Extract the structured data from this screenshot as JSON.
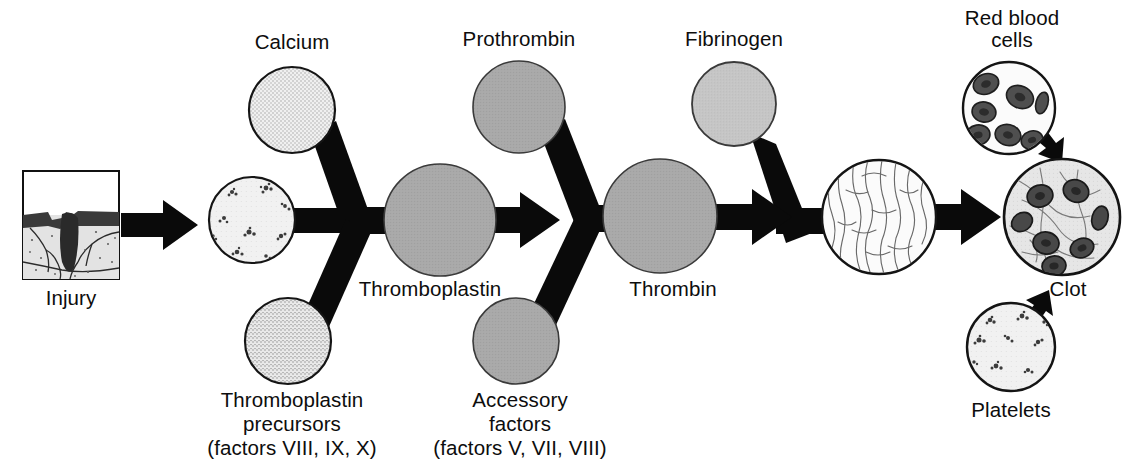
{
  "diagram": {
    "colors": {
      "ink": "#0d0d0d",
      "connector": "#0a0a0a",
      "circle_outline": "#111111",
      "pale_stipple_fill": "#efefef",
      "light_gray_fill": "#d6d6d6",
      "medium_gray_fill": "#a8a8a8",
      "dark_gray_fill": "#9a9a9a",
      "white_fill": "#fbfbfb",
      "clot_fill": "#e4e4e4",
      "cell_fill": "#4a4a4a",
      "background": "#ffffff"
    },
    "nodes": [
      {
        "id": "injury",
        "label": "Injury",
        "kind": "image-box",
        "label_position": "below",
        "cx": 71,
        "cy": 225,
        "box": {
          "x": 22,
          "y": 170,
          "w": 98,
          "h": 110
        }
      },
      {
        "id": "calcium",
        "label": "Calcium",
        "kind": "circle",
        "texture": "stipple-fine",
        "label_position": "above",
        "cx": 292,
        "cy": 110,
        "r": 43,
        "fill": "#efefef"
      },
      {
        "id": "platelets-main",
        "label": "",
        "kind": "circle",
        "texture": "platelet-clusters",
        "label_position": "none",
        "cx": 252,
        "cy": 220,
        "r": 43,
        "fill": "#f2f2f2"
      },
      {
        "id": "thromboplastin-precursors",
        "label": "Thromboplastin\nprecursors\n(factors VIII, IX, X)",
        "kind": "circle",
        "texture": "stipple-fine",
        "label_position": "below",
        "cx": 288,
        "cy": 341,
        "r": 43,
        "fill": "#e8e8e8"
      },
      {
        "id": "thromboplastin",
        "label": "Thromboplastin",
        "kind": "circle",
        "texture": "flat",
        "label_position": "below",
        "cx": 440,
        "cy": 220,
        "r": 56,
        "fill": "#adadad"
      },
      {
        "id": "prothrombin",
        "label": "Prothrombin",
        "kind": "circle",
        "texture": "flat",
        "label_position": "above",
        "cx": 519,
        "cy": 107,
        "r": 46,
        "fill": "#a6a6a6"
      },
      {
        "id": "accessory-factors",
        "label": "Accessory\nfactors\n(factors V, VII, VIII)",
        "kind": "circle",
        "texture": "flat",
        "label_position": "below",
        "cx": 516,
        "cy": 341,
        "r": 43,
        "fill": "#a3a3a3"
      },
      {
        "id": "thrombin",
        "label": "Thrombin",
        "kind": "circle",
        "texture": "flat",
        "label_position": "below",
        "cx": 660,
        "cy": 216,
        "r": 57,
        "fill": "#a8a8a8"
      },
      {
        "id": "fibrinogen",
        "label": "Fibrinogen",
        "kind": "circle",
        "texture": "flat",
        "label_position": "above",
        "cx": 734,
        "cy": 104,
        "r": 42,
        "fill": "#c4c4c4"
      },
      {
        "id": "fibrin",
        "label": "",
        "kind": "circle",
        "texture": "fibrin-strands",
        "label_position": "none",
        "cx": 879,
        "cy": 217,
        "r": 57,
        "fill": "#fbfbfb"
      },
      {
        "id": "red-blood-cells",
        "label": "Red blood\ncells",
        "kind": "circle",
        "texture": "red-blood-cells",
        "label_position": "above",
        "cx": 1009,
        "cy": 108,
        "r": 46,
        "fill": "#fbfbfb"
      },
      {
        "id": "platelets",
        "label": "Platelets",
        "kind": "circle",
        "texture": "platelet-clusters",
        "label_position": "below",
        "cx": 1011,
        "cy": 347,
        "r": 44,
        "fill": "#f2f2f2"
      },
      {
        "id": "clot",
        "label": "Clot",
        "kind": "circle",
        "texture": "clot",
        "label_position": "right-below",
        "cx": 1062,
        "cy": 217,
        "r": 58,
        "fill": "#e4e4e4"
      }
    ],
    "labels": {
      "injury": "Injury",
      "calcium": "Calcium",
      "thromboplastin_precursors_line1": "Thromboplastin",
      "thromboplastin_precursors_line2": "precursors",
      "thromboplastin_precursors_line3": "(factors VIII, IX, X)",
      "thromboplastin": "Thromboplastin",
      "prothrombin": "Prothrombin",
      "accessory_factors_line1": "Accessory",
      "accessory_factors_line2": "factors",
      "accessory_factors_line3": "(factors V, VII, VIII)",
      "thrombin": "Thrombin",
      "fibrinogen": "Fibrinogen",
      "red_blood_cells_line1": "Red blood",
      "red_blood_cells_line2": "cells",
      "platelets": "Platelets",
      "clot": "Clot"
    },
    "connectors": [
      {
        "id": "calcium-to-junction",
        "from": "calcium",
        "to": "junction-1",
        "type": "bar"
      },
      {
        "id": "platelets-to-junction",
        "from": "platelets-main",
        "to": "junction-1",
        "type": "bar"
      },
      {
        "id": "precursors-to-junction",
        "from": "thromboplastin-precursors",
        "to": "junction-1",
        "type": "bar"
      },
      {
        "id": "junction-to-thromboplastin",
        "from": "junction-1",
        "to": "thromboplastin",
        "type": "bar"
      },
      {
        "id": "prothrombin-to-junction2",
        "from": "prothrombin",
        "to": "junction-2",
        "type": "bar"
      },
      {
        "id": "accessory-to-junction2",
        "from": "accessory-factors",
        "to": "junction-2",
        "type": "bar"
      },
      {
        "id": "junction2-to-thrombin",
        "from": "junction-2",
        "to": "thrombin",
        "type": "bar"
      },
      {
        "id": "fibrinogen-to-fibrin",
        "from": "fibrinogen",
        "to": "fibrin",
        "type": "bent-bar"
      }
    ],
    "arrows": [
      {
        "id": "injury-to-platelets",
        "from": "injury",
        "to": "platelets-main",
        "direction": "right"
      },
      {
        "id": "thromboplastin-to-junction2",
        "from": "thromboplastin",
        "to": "junction-2",
        "direction": "right"
      },
      {
        "id": "thrombin-to-fibrin",
        "from": "thrombin",
        "to": "fibrin",
        "direction": "right"
      },
      {
        "id": "fibrin-to-clot",
        "from": "fibrin",
        "to": "clot",
        "direction": "right"
      },
      {
        "id": "rbc-to-clot",
        "from": "red-blood-cells",
        "to": "clot",
        "direction": "down-right"
      },
      {
        "id": "platelets-to-clot",
        "from": "platelets",
        "to": "clot",
        "direction": "up-right"
      }
    ]
  }
}
